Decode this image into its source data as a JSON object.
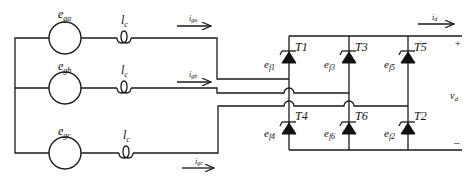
{
  "diagram": {
    "type": "circuit",
    "sources": [
      {
        "id": "a",
        "label": "e",
        "sub": "ga"
      },
      {
        "id": "b",
        "label": "e",
        "sub": "gb"
      },
      {
        "id": "c",
        "label": "e",
        "sub": "gc"
      }
    ],
    "inductors": [
      {
        "label": "l",
        "sub": "c"
      },
      {
        "label": "l",
        "sub": "c"
      },
      {
        "label": "l",
        "sub": "c"
      }
    ],
    "currents": [
      {
        "label": "i",
        "sub": "ga"
      },
      {
        "label": "i",
        "sub": "gb"
      },
      {
        "label": "i",
        "sub": "gc"
      }
    ],
    "thyristors": [
      {
        "name": "T1",
        "gate": "e",
        "gate_sub": "f1"
      },
      {
        "name": "T3",
        "gate": "e",
        "gate_sub": "f3"
      },
      {
        "name": "T5",
        "gate": "e",
        "gate_sub": "f5"
      },
      {
        "name": "T4",
        "gate": "e",
        "gate_sub": "f4"
      },
      {
        "name": "T6",
        "gate": "e",
        "gate_sub": "f6"
      },
      {
        "name": "T2",
        "gate": "e",
        "gate_sub": "f2"
      }
    ],
    "output": {
      "current": "i",
      "current_sub": "d",
      "voltage": "v",
      "voltage_sub": "d",
      "plus": "+",
      "minus": "–"
    }
  }
}
